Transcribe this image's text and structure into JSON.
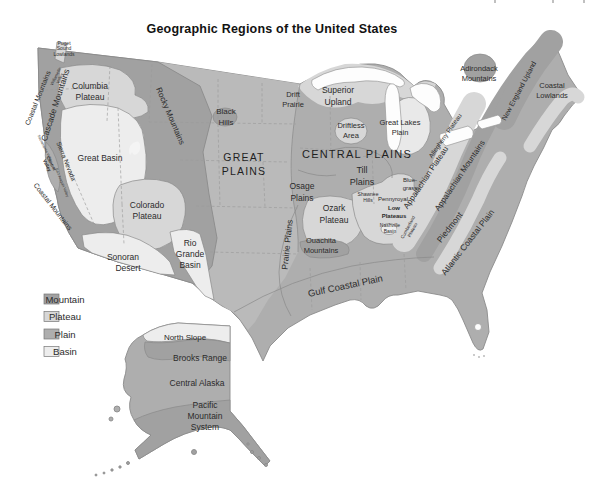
{
  "page": {
    "title": "Geographic Regions of the United States"
  },
  "palette": {
    "mountain": "#a1a1a1",
    "plateau": "#d7d7d7",
    "plain": "#aeaeae",
    "plain_light": "#bababa",
    "basin": "#ededed",
    "michigan_lowland": "#e9e9e9",
    "water": "#fdfdfd",
    "outline": "#8b8b8b"
  },
  "legend": {
    "items": [
      {
        "label": "Mountain",
        "color": "#a1a1a1"
      },
      {
        "label": "Plateau",
        "color": "#d7d7d7"
      },
      {
        "label": "Plain",
        "color": "#aeaeae"
      },
      {
        "label": "Basin",
        "color": "#ededed"
      }
    ]
  },
  "map": {
    "labels": {
      "puget_sound_lowlands": {
        "lines": [
          "Puget",
          "Sound",
          "Lowlands"
        ]
      },
      "coastal_mountains_north": {
        "text": "Coastal Mountains"
      },
      "cascade_mountains": {
        "text": "Cascade Mountains"
      },
      "willamette_valley": {
        "lines": [
          "Willamette",
          "Valley"
        ]
      },
      "columbia_plateau": {
        "lines": [
          "Columbia",
          "Plateau"
        ]
      },
      "sierra_nevada": {
        "text": "Sierra Nevada"
      },
      "sacramento_valley": {
        "text": "Sacramento Valley"
      },
      "central_valley": {
        "lines": [
          "Central",
          "Valley"
        ]
      },
      "san_joaquin_valley": {
        "text": "San Joaquin Valley"
      },
      "coastal_mountains_south": {
        "text": "Coastal Mountains"
      },
      "great_basin": {
        "text": "Great Basin"
      },
      "colorado_plateau": {
        "lines": [
          "Colorado",
          "Plateau"
        ]
      },
      "sonoran_desert": {
        "lines": [
          "Sonoran",
          "Desert"
        ]
      },
      "rio_grande_basin": {
        "lines": [
          "Rio",
          "Grande",
          "Basin"
        ]
      },
      "rocky_mountains": {
        "text": "Rocky Mountains"
      },
      "black_hills": {
        "lines": [
          "Black",
          "Hills"
        ]
      },
      "great_plains": {
        "lines": [
          "GREAT",
          "PLAINS"
        ]
      },
      "drift_prairie": {
        "lines": [
          "Drift",
          "Prairie"
        ]
      },
      "superior_upland": {
        "lines": [
          "Superior",
          "Upland"
        ]
      },
      "driftless_area": {
        "lines": [
          "Driftless",
          "Area"
        ]
      },
      "great_lakes_plain": {
        "lines": [
          "Great Lakes",
          "Plain"
        ]
      },
      "central_plains": {
        "text": "CENTRAL PLAINS"
      },
      "till_plains": {
        "lines": [
          "Till",
          "Plains"
        ]
      },
      "osage_plains": {
        "lines": [
          "Osage",
          "Plains"
        ]
      },
      "ozark_plateau": {
        "lines": [
          "Ozark",
          "Plateau"
        ]
      },
      "ouachita_mountains": {
        "lines": [
          "Ouachita",
          "Mountains"
        ]
      },
      "prairie_plains": {
        "text": "Prairie Plains"
      },
      "gulf_coastal_plain": {
        "text": "Gulf Coastal Plain"
      },
      "shawnee_hills": {
        "lines": [
          "Shawnee",
          "Hills"
        ]
      },
      "blue_grass": {
        "lines": [
          "Blue-",
          "grass"
        ]
      },
      "pennyroyal": {
        "text": "Pennyroyal"
      },
      "low_plateaus": {
        "lines": [
          "Low",
          "Plateaus"
        ]
      },
      "nashville_basin": {
        "lines": [
          "Nashville",
          "Basin"
        ]
      },
      "cumberland_plateau": {
        "lines": [
          "Cumberland",
          "Plateau"
        ]
      },
      "allegheny_plateau": {
        "text": "Allegheny Plateau"
      },
      "appalachian_plateau": {
        "text": "Appalachian Plateau"
      },
      "appalachian_mountains": {
        "text": "Appalachian Mountains"
      },
      "piedmont": {
        "text": "Piedmont"
      },
      "atlantic_coastal_plain": {
        "text": "Atlantic Coastal Plain"
      },
      "new_england_upland": {
        "text": "New England Upland"
      },
      "adirondack_mountains": {
        "lines": [
          "Adirondack",
          "Mountains"
        ]
      },
      "coastal_lowlands": {
        "lines": [
          "Coastal",
          "Lowlands"
        ]
      },
      "north_slope": {
        "text": "North Slope"
      },
      "brooks_range": {
        "text": "Brooks Range"
      },
      "central_alaska": {
        "text": "Central Alaska"
      },
      "pacific_mountain_system": {
        "lines": [
          "Pacific",
          "Mountain",
          "System"
        ]
      }
    }
  }
}
